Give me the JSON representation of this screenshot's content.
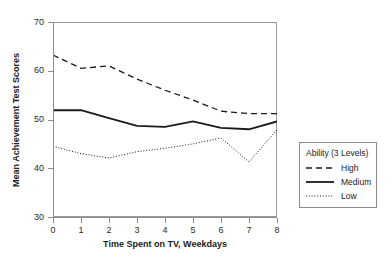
{
  "figure": {
    "top_clipped_caption": "            ",
    "legend_title": "Ability (3 Levels)"
  },
  "chart_data": {
    "type": "line",
    "title": "",
    "xlabel": "Time Spent on TV, Weekdays",
    "ylabel": "Mean Achievement Test Scores",
    "x": [
      0,
      1,
      2,
      3,
      4,
      5,
      6,
      7,
      8
    ],
    "xlim": [
      0,
      8
    ],
    "ylim": [
      30,
      70
    ],
    "xticks": [
      0,
      1,
      2,
      3,
      4,
      5,
      6,
      7,
      8
    ],
    "yticks": [
      30,
      40,
      50,
      60,
      70
    ],
    "xticklabels": [
      "0",
      "1",
      "2",
      "3",
      "4",
      "5",
      "6",
      "7",
      "8"
    ],
    "yticklabels": [
      "30",
      "40",
      "50",
      "60",
      "70"
    ],
    "grid": false,
    "legend_position": "right-outside",
    "series": [
      {
        "name": "High",
        "style": "dashed",
        "color": "#1a1a1a",
        "values": [
          63.2,
          60.5,
          61.0,
          58.3,
          56.0,
          54.0,
          51.7,
          51.2,
          51.2
        ]
      },
      {
        "name": "Medium",
        "style": "solid",
        "color": "#1a1a1a",
        "values": [
          51.9,
          51.9,
          50.3,
          48.7,
          48.5,
          49.6,
          48.3,
          48.0,
          49.6
        ]
      },
      {
        "name": "Low",
        "style": "dotted",
        "color": "#1a1a1a",
        "values": [
          44.5,
          43.0,
          42.1,
          43.4,
          44.1,
          45.0,
          46.2,
          41.3,
          47.9
        ]
      }
    ]
  }
}
